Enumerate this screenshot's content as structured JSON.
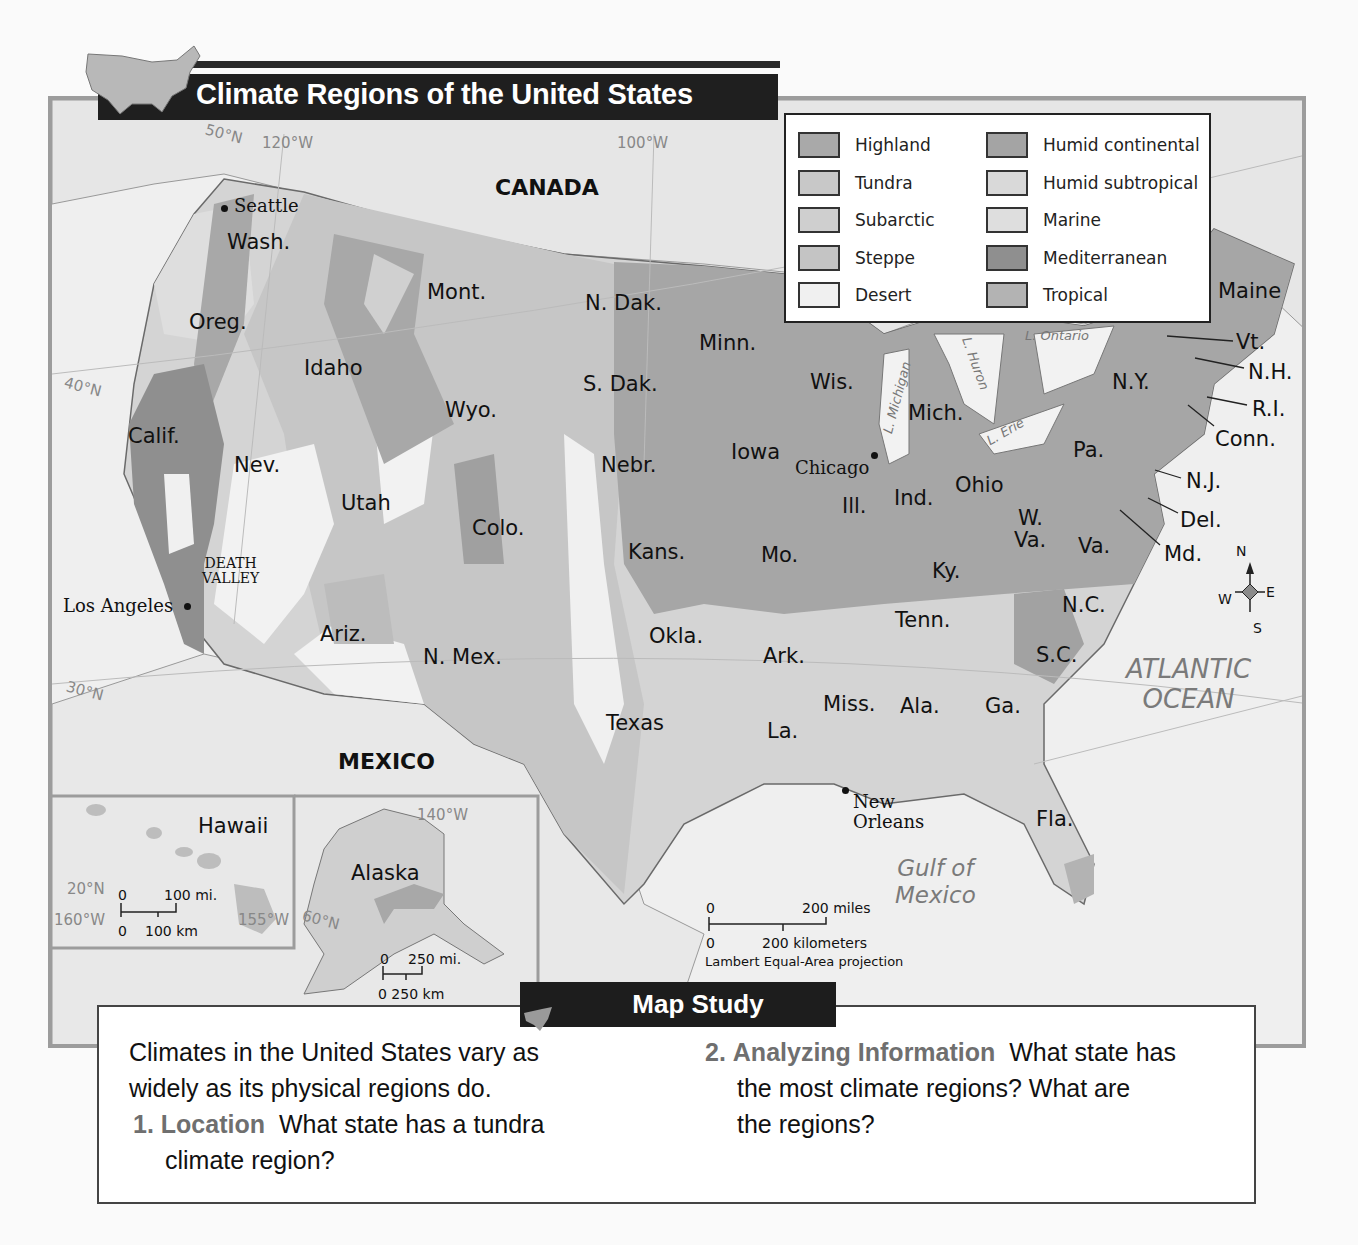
{
  "header": {
    "title": "Climate Regions of the United States"
  },
  "legend": {
    "items": [
      {
        "label": "Highland",
        "color": "#a9a9a9"
      },
      {
        "label": "Tundra",
        "color": "#c8c8c8"
      },
      {
        "label": "Subarctic",
        "color": "#cfcfcf"
      },
      {
        "label": "Steppe",
        "color": "#c4c4c4"
      },
      {
        "label": "Desert",
        "color": "#f0f0f0"
      },
      {
        "label": "Humid continental",
        "color": "#a4a4a4"
      },
      {
        "label": "Humid subtropical",
        "color": "#d9d9d9"
      },
      {
        "label": "Marine",
        "color": "#dedede"
      },
      {
        "label": "Mediterranean",
        "color": "#8f8f8f"
      },
      {
        "label": "Tropical",
        "color": "#b3b3b3"
      }
    ]
  },
  "map": {
    "countries": {
      "canada": "CANADA",
      "mexico": "MEXICO"
    },
    "oceans": {
      "atlantic_line1": "ATLANTIC",
      "atlantic_line2": "OCEAN",
      "gulf_line1": "Gulf of",
      "gulf_line2": "Mexico"
    },
    "lakes": {
      "michigan": "L. Michigan",
      "huron": "L. Huron",
      "erie": "L. Erie",
      "ontario": "L. Ontario"
    },
    "cities": {
      "seattle": "Seattle",
      "los_angeles": "Los Angeles",
      "chicago": "Chicago",
      "new_orleans_1": "New",
      "new_orleans_2": "Orleans"
    },
    "places": {
      "death_valley_1": "DEATH",
      "death_valley_2": "VALLEY"
    },
    "gridlines": {
      "lat50": "50°N",
      "lon120": "120°W",
      "lon100": "100°W",
      "lat40": "40°N",
      "lat30": "30°N",
      "lat20": "20°N",
      "lon160": "160°W",
      "lon155": "155°W",
      "lat60": "60°N",
      "lon140": "140°W"
    },
    "states": {
      "wash": "Wash.",
      "oreg": "Oreg.",
      "calif": "Calif.",
      "idaho": "Idaho",
      "nev": "Nev.",
      "mont": "Mont.",
      "wyo": "Wyo.",
      "utah": "Utah",
      "colo": "Colo.",
      "ariz": "Ariz.",
      "nmex": "N. Mex.",
      "ndak": "N. Dak.",
      "sdak": "S. Dak.",
      "nebr": "Nebr.",
      "kans": "Kans.",
      "okla": "Okla.",
      "texas": "Texas",
      "minn": "Minn.",
      "iowa": "Iowa",
      "mo": "Mo.",
      "ark": "Ark.",
      "la": "La.",
      "wis": "Wis.",
      "ill": "Ill.",
      "mich": "Mich.",
      "ind": "Ind.",
      "ohio": "Ohio",
      "ky": "Ky.",
      "tenn": "Tenn.",
      "miss": "Miss.",
      "ala": "Ala.",
      "ga": "Ga.",
      "fla": "Fla.",
      "sc": "S.C.",
      "nc": "N.C.",
      "va": "Va.",
      "wva1": "W.",
      "wva2": "Va.",
      "pa": "Pa.",
      "ny": "N.Y.",
      "maine": "Maine",
      "vt": "Vt.",
      "nh": "N.H.",
      "ri": "R.I.",
      "conn": "Conn.",
      "nj": "N.J.",
      "del": "Del.",
      "md": "Md.",
      "hawaii": "Hawaii",
      "alaska": "Alaska"
    },
    "compass": {
      "n": "N",
      "s": "S",
      "e": "E",
      "w": "W"
    },
    "scale_main": {
      "mi_zero": "0",
      "mi_label": "200 miles",
      "km_zero": "0",
      "km_label": "200 kilometers",
      "projection": "Lambert Equal-Area projection"
    },
    "scale_hawaii": {
      "mi_zero": "0",
      "mi_label": "100 mi.",
      "km_zero": "0",
      "km_label": "100 km"
    },
    "scale_alaska": {
      "mi_zero": "0",
      "mi_label": "250 mi.",
      "km_label": "0 250 km"
    }
  },
  "map_study": {
    "tab_label": "Map Study",
    "intro_line1": "Climates in the United States vary as",
    "intro_line2": "widely as its physical regions do.",
    "q1_number": "1.",
    "q1_label": "Location",
    "q1_line1": "What state has a tundra",
    "q1_line2": "climate region?",
    "q2_number": "2.",
    "q2_label": "Analyzing Information",
    "q2_line1": "What state has",
    "q2_line2": "the most climate regions?  What are",
    "q2_line3": "the regions?"
  }
}
